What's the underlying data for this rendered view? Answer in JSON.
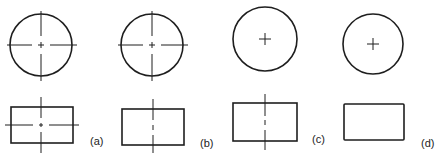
{
  "figure": {
    "panels": [
      {
        "id": "a",
        "label": "(a)",
        "circle_centerlines": "full",
        "rect_centerlines": "both"
      },
      {
        "id": "b",
        "label": "(b)",
        "circle_centerlines": "full",
        "rect_centerlines": "vertical"
      },
      {
        "id": "c",
        "label": "(c)",
        "circle_centerlines": "cross-only",
        "rect_centerlines": "vertical"
      },
      {
        "id": "d",
        "label": "(d)",
        "circle_centerlines": "cross-only",
        "rect_centerlines": "none"
      }
    ],
    "line_color": "#1e1e1e",
    "background": "#ffffff"
  }
}
